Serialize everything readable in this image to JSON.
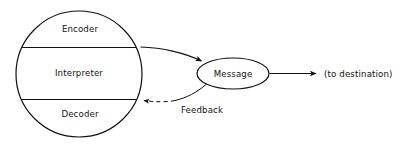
{
  "diagram": {
    "background_color": "#ffffff",
    "line_color": "#111111",
    "text_color": "#111111",
    "source_circle": {
      "name": "source-circle",
      "segments": [
        {
          "id": "encoder",
          "label": "Encoder"
        },
        {
          "id": "interpreter",
          "label": "Interpreter"
        },
        {
          "id": "decoder",
          "label": "Decoder"
        }
      ]
    },
    "message_node": {
      "name": "message-ellipse",
      "label": "Message"
    },
    "connectors": [
      {
        "id": "encoder-to-message",
        "label": "",
        "style": "solid",
        "arrowhead": "end",
        "from": "encoder",
        "to": "message"
      },
      {
        "id": "message-to-decoder",
        "label": "Feedback",
        "style": "dashed",
        "arrowhead": "end",
        "from": "message",
        "to": "decoder"
      },
      {
        "id": "message-to-destination",
        "label": "(to destination)",
        "style": "solid",
        "arrowhead": "end",
        "from": "message",
        "to": "destination"
      }
    ],
    "destination_label": "(to destination)",
    "feedback_label": "Feedback"
  }
}
